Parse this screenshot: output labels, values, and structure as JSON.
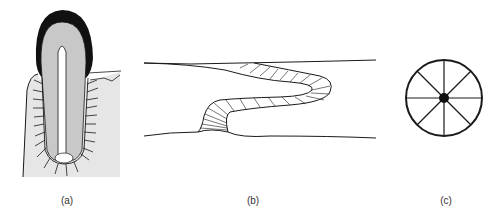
{
  "figure": {
    "panels": [
      {
        "id": "a",
        "label": "(a)",
        "subject": "tooth-in-socket-with-periodontal-fibers"
      },
      {
        "id": "b",
        "label": "(b)",
        "subject": "s-shaped-fibrous-band-between-surfaces"
      },
      {
        "id": "c",
        "label": "(c)",
        "subject": "wheel-with-eight-spokes-and-hub"
      }
    ],
    "colors": {
      "stroke": "#1a1a1a",
      "enamel": "#111111",
      "dentin": "#c8c8c8",
      "bone": "#e6e6e6",
      "background": "#ffffff"
    }
  }
}
